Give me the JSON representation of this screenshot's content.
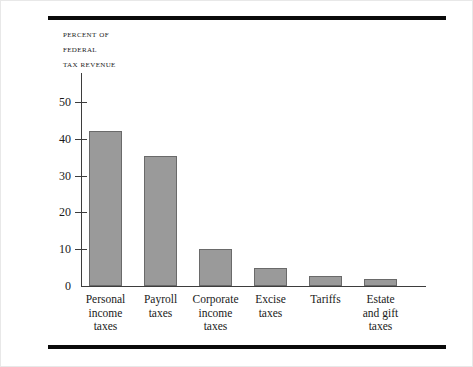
{
  "figure": {
    "axis_title_lines": [
      "Percent of",
      "Federal",
      "Tax Revenue"
    ]
  },
  "chart_data": {
    "type": "bar",
    "title": "",
    "subtitle": "",
    "xlabel": "",
    "ylabel": "Percent of Federal Tax Revenue",
    "ylim": [
      0,
      50
    ],
    "yticks": [
      0,
      10,
      20,
      30,
      40,
      50
    ],
    "ytick_labels": [
      "0",
      "10",
      "20",
      "30",
      "40",
      "50"
    ],
    "grid": false,
    "legend": false,
    "categories": [
      "Personal income taxes",
      "Payroll taxes",
      "Corporate income taxes",
      "Excise taxes",
      "Tariffs",
      "Estate and gift taxes"
    ],
    "category_label_lines": [
      [
        "Personal",
        "income",
        "taxes"
      ],
      [
        "Payroll",
        "taxes"
      ],
      [
        "Corporate",
        "income",
        "taxes"
      ],
      [
        "Excise",
        "taxes"
      ],
      [
        "Tariffs"
      ],
      [
        "Estate",
        "and gift",
        "taxes"
      ]
    ],
    "values": [
      42,
      35.3,
      10,
      4.8,
      2.8,
      1.8
    ],
    "bar_color": "#9a9a9a",
    "bar_edge_color": "#6a6a6a"
  }
}
